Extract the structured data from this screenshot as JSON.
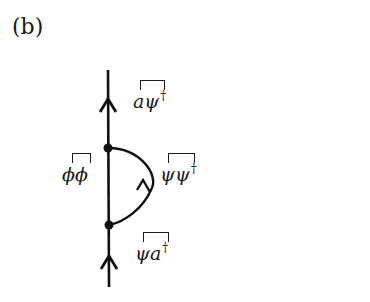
{
  "panel_label": "(b)",
  "diagram": {
    "type": "feynman-diagram",
    "line_color": "#111111",
    "labels": {
      "top": {
        "text": "aψ",
        "dagger": "†",
        "contraction": "a–ψ†"
      },
      "left": {
        "text": "ϕϕ",
        "dagger": "",
        "contraction": "ϕ–ϕ"
      },
      "arc": {
        "text": "ψψ",
        "dagger": "†",
        "contraction": "ψ–ψ†"
      },
      "bottom": {
        "text": "ψa",
        "dagger": "†",
        "contraction": "ψ–a†"
      }
    },
    "vertices": [
      {
        "name": "upper-vertex",
        "x": 108,
        "y": 148
      },
      {
        "name": "lower-vertex",
        "x": 109,
        "y": 225
      }
    ]
  }
}
